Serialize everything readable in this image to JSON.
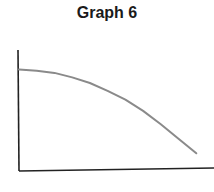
{
  "chart_data": {
    "type": "line",
    "title": "Graph 6",
    "xlabel": "",
    "ylabel": "",
    "x_ticks": [],
    "y_ticks": [],
    "grid": false,
    "legend": null,
    "series": [
      {
        "name": "curve",
        "color": "#8a8a8a",
        "x": [
          0,
          0.1,
          0.2,
          0.3,
          0.4,
          0.5,
          0.6,
          0.7,
          0.8,
          0.9,
          1.0
        ],
        "y": [
          0.9,
          0.89,
          0.87,
          0.83,
          0.78,
          0.71,
          0.63,
          0.53,
          0.41,
          0.28,
          0.15
        ]
      }
    ],
    "xlim": [
      0,
      1.1
    ],
    "ylim": [
      0,
      1.0
    ]
  },
  "colors": {
    "axis": "#222222",
    "curve": "#8a8a8a"
  }
}
